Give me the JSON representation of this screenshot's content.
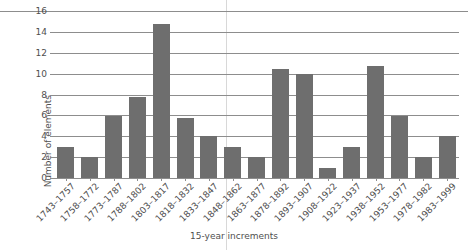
{
  "chart_data": {
    "type": "bar",
    "title": "",
    "xlabel": "15-year increments",
    "ylabel": "Number of elements",
    "ylim": [
      0,
      16
    ],
    "yticks": [
      0,
      2,
      4,
      6,
      8,
      10,
      12,
      14,
      16
    ],
    "grid": true,
    "legend": null,
    "bar_color": "#6e6e6e",
    "axis_color": "#8d8d8d",
    "background_color": "#ffffff",
    "categories": [
      "1743–1757",
      "1758–1772",
      "1773–1787",
      "1788–1802",
      "1803–1817",
      "1818–1832",
      "1833–1847",
      "1848–1862",
      "1863–1877",
      "1878–1892",
      "1893–1907",
      "1908–1922",
      "1923–1937",
      "1938–1952",
      "1953–1977",
      "1978–1982",
      "1983–1999"
    ],
    "values": [
      3,
      2,
      6,
      7.8,
      14.8,
      5.8,
      4,
      3,
      2,
      10.5,
      10,
      1,
      3,
      10.8,
      6,
      2,
      4
    ]
  }
}
